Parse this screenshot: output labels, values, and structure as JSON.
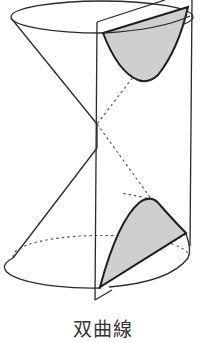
{
  "figure": {
    "result_curve": "hyperbola",
    "colors": {
      "stroke": "#2a2a2a",
      "section_fill": "#cfcfcf",
      "hidden_line": "#555555",
      "background": "#ffffff"
    }
  },
  "caption": {
    "text": "双曲線"
  }
}
